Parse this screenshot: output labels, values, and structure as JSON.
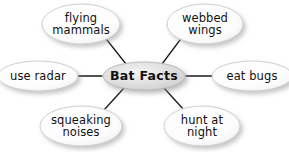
{
  "diagram": {
    "type": "mind-map",
    "title": "Bat Facts",
    "background_color": "#ffffff",
    "text_color": "#111111",
    "node_fill_color": "#fbfbfb",
    "node_stroke_color": "#c9c9c9",
    "center_fill_color": "#e2e2e2",
    "connector_color": "#1a1a1a",
    "center": {
      "label": "Bat Facts",
      "cx": 144,
      "cy": 76,
      "rx": 41,
      "ry": 14
    },
    "branches": [
      {
        "id": "flying-mammals",
        "label": "flying\nmammals",
        "cx": 81,
        "cy": 24,
        "rx": 39,
        "ry": 20,
        "connector": {
          "x1": 107,
          "y1": 40,
          "x2": 126,
          "y2": 64
        }
      },
      {
        "id": "webbed-wings",
        "label": "webbed\nwings",
        "cx": 205,
        "cy": 24,
        "rx": 38,
        "ry": 20,
        "connector": {
          "x1": 180,
          "y1": 40,
          "x2": 162,
          "y2": 64
        }
      },
      {
        "id": "use-radar",
        "label": "use radar",
        "cx": 38,
        "cy": 76,
        "rx": 40,
        "ry": 15,
        "connector": {
          "x1": 77,
          "y1": 76,
          "x2": 102,
          "y2": 76
        }
      },
      {
        "id": "eat-bugs",
        "label": "eat bugs",
        "cx": 252,
        "cy": 76,
        "rx": 40,
        "ry": 15,
        "connector": {
          "x1": 186,
          "y1": 76,
          "x2": 212,
          "y2": 76
        }
      },
      {
        "id": "squeaking-noises",
        "label": "squeaking\nnoises",
        "cx": 81,
        "cy": 126,
        "rx": 41,
        "ry": 20,
        "connector": {
          "x1": 124,
          "y1": 88,
          "x2": 104,
          "y2": 110
        }
      },
      {
        "id": "hunt-at-night",
        "label": "hunt at\nnight",
        "cx": 202,
        "cy": 126,
        "rx": 38,
        "ry": 20,
        "connector": {
          "x1": 164,
          "y1": 88,
          "x2": 184,
          "y2": 110
        }
      }
    ]
  }
}
